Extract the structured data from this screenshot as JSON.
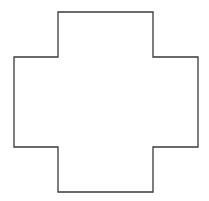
{
  "canvas": {
    "width": 209,
    "height": 201,
    "background": "#ffffff"
  },
  "shape": {
    "type": "cross-polygon",
    "points": "58,12 153,12 153,57 198,57 198,147 153,147 153,192 58,192 58,147 14,147 14,57 58,57",
    "stroke": "#3a3a3a",
    "stroke_width": 1.3,
    "fill": "none"
  }
}
